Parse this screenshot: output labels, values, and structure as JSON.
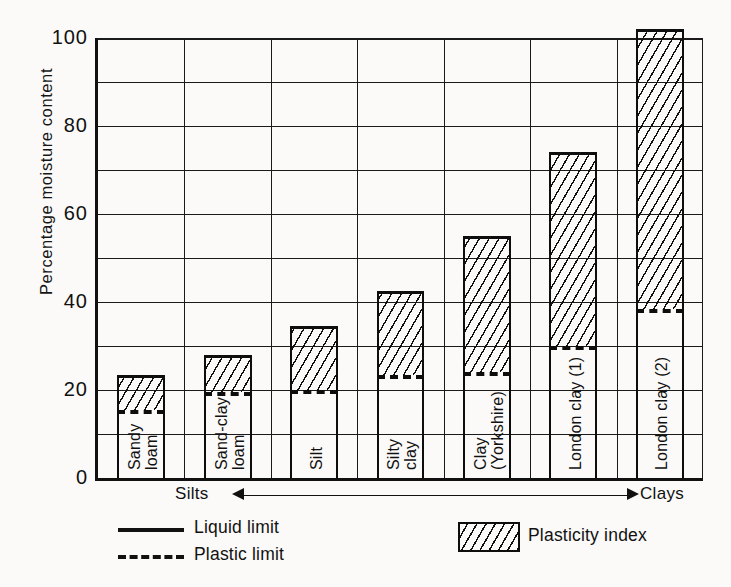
{
  "chart_data": {
    "type": "bar",
    "title": "",
    "xlabel": "",
    "ylabel": "Percentage moisture content",
    "ylim": [
      0,
      100
    ],
    "yticks": [
      0,
      20,
      40,
      60,
      80,
      100
    ],
    "ytick_labels": [
      "0",
      "20",
      "40",
      "60",
      "80",
      "100"
    ],
    "gridline_step": 10,
    "grid": true,
    "legend_position": "below-axes",
    "categories": [
      "Sandy\nloam",
      "Sand-clay\nloam",
      "Silt",
      "Silty\nclay",
      "Clay\n(Yorkshire)",
      "London clay (1)",
      "London clay (2)"
    ],
    "series": [
      {
        "name": "Liquid limit",
        "values": [
          23.5,
          28.0,
          34.5,
          42.5,
          55.0,
          74.0,
          102.0
        ]
      },
      {
        "name": "Plastic limit",
        "values": [
          15.5,
          19.5,
          20.0,
          23.5,
          24.0,
          30.0,
          38.5
        ]
      },
      {
        "name": "Plasticity index",
        "values": [
          8.0,
          8.5,
          14.5,
          19.0,
          31.0,
          44.0,
          63.5
        ]
      }
    ],
    "annotations": {
      "axis_direction_left": "Silts",
      "axis_direction_right": "Clays"
    }
  },
  "axis": {
    "y_title": "Percentage moisture content"
  },
  "direction": {
    "left_label": "Silts",
    "right_label": "Clays"
  },
  "legend": {
    "liquid_limit": "Liquid limit",
    "plastic_limit": "Plastic limit",
    "plasticity_index": "Plasticity index"
  }
}
